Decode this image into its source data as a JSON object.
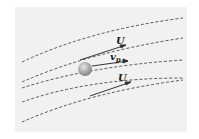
{
  "diagram": {
    "labels": {
      "fluid_velocity_upper": "U",
      "particle_velocity": "v",
      "particle_velocity_subscript": "p",
      "fluid_velocity_lower": "U"
    },
    "colors": {
      "background": "#f1f1f1",
      "streamline": "#444444",
      "arrow": "#333333",
      "particle": "#9a9a9a"
    }
  }
}
